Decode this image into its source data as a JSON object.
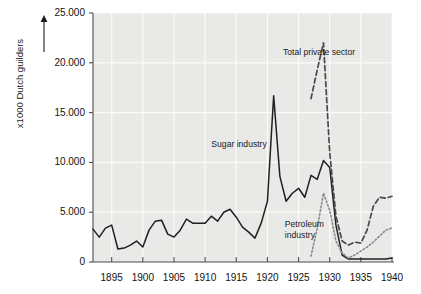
{
  "chart_data": {
    "type": "line",
    "title": "",
    "xlabel": "",
    "ylabel": "x1000 Dutch guilders",
    "xlim": [
      1892,
      1940
    ],
    "ylim": [
      0,
      25000
    ],
    "grid": true,
    "legend": "inline-annotations",
    "y_ticks": [
      0,
      5000,
      10000,
      15000,
      20000,
      25000
    ],
    "y_tick_labels": [
      "0",
      "5.000",
      "10.000",
      "15.000",
      "20.000",
      "25.000"
    ],
    "x_ticks": [
      1895,
      1900,
      1905,
      1910,
      1915,
      1920,
      1925,
      1930,
      1935,
      1940
    ],
    "x_tick_labels": [
      "1895",
      "1900",
      "1905",
      "1910",
      "1915",
      "1920",
      "1925",
      "1930",
      "1935",
      "1940"
    ],
    "series": [
      {
        "name": "Sugar industry",
        "style": "solid",
        "color": "#231f20",
        "x": [
          1892,
          1893,
          1894,
          1895,
          1896,
          1897,
          1898,
          1899,
          1900,
          1901,
          1902,
          1903,
          1904,
          1905,
          1906,
          1907,
          1908,
          1909,
          1910,
          1911,
          1912,
          1913,
          1914,
          1915,
          1916,
          1917,
          1918,
          1919,
          1920,
          1921,
          1922,
          1923,
          1924,
          1925,
          1926,
          1927,
          1928,
          1929,
          1930,
          1931,
          1932,
          1933,
          1934,
          1935,
          1936,
          1937,
          1938,
          1939,
          1940
        ],
        "values": [
          3300,
          2500,
          3400,
          3700,
          1300,
          1400,
          1700,
          2100,
          1500,
          3200,
          4100,
          4200,
          2800,
          2500,
          3200,
          4300,
          3900,
          3900,
          3900,
          4600,
          4100,
          5000,
          5300,
          4500,
          3500,
          3000,
          2400,
          3900,
          6100,
          16700,
          8600,
          6100,
          6900,
          7400,
          6500,
          8700,
          8300,
          10200,
          9500,
          3700,
          700,
          300,
          300,
          300,
          300,
          300,
          300,
          300,
          400
        ]
      },
      {
        "name": "Total private sector",
        "style": "dashed",
        "color": "#4a4a4a",
        "x": [
          1927,
          1928,
          1929,
          1930,
          1931,
          1932,
          1933,
          1934,
          1935,
          1936,
          1937,
          1938,
          1939,
          1940
        ],
        "values": [
          16400,
          19300,
          22000,
          11000,
          4600,
          2100,
          1700,
          2000,
          1900,
          3200,
          5600,
          6500,
          6400,
          6600
        ]
      },
      {
        "name": "Petroleum industry",
        "style": "dotted",
        "color": "#8a8a8a",
        "x": [
          1927,
          1928,
          1929,
          1930,
          1931,
          1932,
          1933,
          1934,
          1935,
          1936,
          1937,
          1938,
          1939,
          1940
        ],
        "values": [
          600,
          3400,
          6900,
          5200,
          2100,
          900,
          400,
          700,
          1100,
          1500,
          2000,
          2600,
          3200,
          3400
        ]
      }
    ],
    "annotations": [
      {
        "text": "Total private sector",
        "x": 1922.5,
        "y": 21600
      },
      {
        "text": "Sugar industry",
        "x": 1911.0,
        "y": 12300
      },
      {
        "text": "Petroleum\nindustry",
        "x": 1922.8,
        "y": 4300
      }
    ]
  }
}
